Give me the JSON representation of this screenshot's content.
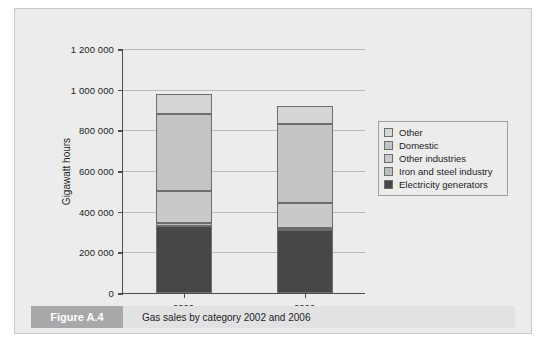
{
  "figure": {
    "tag": "Figure A.4",
    "caption": "Gas sales by category 2002 and 2006"
  },
  "colors": {
    "panel_background": "#ececed",
    "panel_border": "#c9c9cb",
    "axis": "#4d4d4d",
    "gridline": "#b9b9bb",
    "bar_outline": "#6d6d6d",
    "caption_tag_background": "#a8a8aa",
    "caption_background": "#e2e2e4",
    "other": "#d5d5d5",
    "domestic": "#c4c4c4",
    "other_industries": "#c9c9c9",
    "iron_and_steel_industry": "#bdbdbd",
    "electricity_generators": "#474747"
  },
  "chart_data": {
    "type": "bar",
    "subtype": "stacked-column",
    "title": "Gas sales by category 2002 and 2006",
    "xlabel": "",
    "ylabel": "Gigawatt hours",
    "categories": [
      "2002",
      "2006"
    ],
    "ylim": [
      0,
      1200000
    ],
    "yticks": [
      0,
      200000,
      400000,
      600000,
      800000,
      1000000,
      1200000
    ],
    "ytick_labels": [
      "0",
      "200 000",
      "400 000",
      "600 000",
      "800 000",
      "1 000 000",
      "1 200 000"
    ],
    "grid": true,
    "legend_position": "right",
    "stack_order_bottom_to_top": [
      "Electricity generators",
      "Iron and steel industry",
      "Other industries",
      "Domestic",
      "Other"
    ],
    "series": [
      {
        "name": "Other",
        "color": "#d5d5d5",
        "values": [
          100000,
          90000
        ]
      },
      {
        "name": "Domestic",
        "color": "#c4c4c4",
        "values": [
          380000,
          385000
        ]
      },
      {
        "name": "Other industries",
        "color": "#c9c9c9",
        "values": [
          155000,
          125000
        ]
      },
      {
        "name": "Iron and steel industry",
        "color": "#bdbdbd",
        "values": [
          15000,
          10000
        ]
      },
      {
        "name": "Electricity generators",
        "color": "#474747",
        "values": [
          330000,
          310000
        ]
      }
    ],
    "totals": [
      980000,
      920000
    ]
  },
  "legend": {
    "items": [
      {
        "label": "Other",
        "color": "#d5d5d5"
      },
      {
        "label": "Domestic",
        "color": "#c4c4c4"
      },
      {
        "label": "Other industries",
        "color": "#c9c9c9"
      },
      {
        "label": "Iron and steel industry",
        "color": "#bdbdbd"
      },
      {
        "label": "Electricity generators",
        "color": "#474747"
      }
    ]
  }
}
